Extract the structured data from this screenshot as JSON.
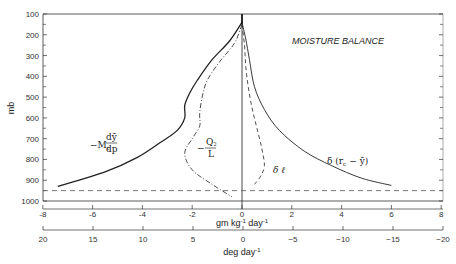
{
  "chart_data": {
    "type": "line",
    "title": "MOISTURE BALANCE",
    "ylabel": "mb",
    "y_ticks": [
      100,
      200,
      300,
      400,
      500,
      600,
      700,
      800,
      900,
      1000
    ],
    "ylim": [
      100,
      1000
    ],
    "y_inverted": true,
    "xaxes": [
      {
        "label": "gm kg⁻¹ day⁻¹",
        "ticks": [
          -8,
          -6,
          -4,
          -2,
          0,
          2,
          4,
          6,
          8
        ],
        "range": [
          -8,
          8
        ]
      },
      {
        "label": "deg day⁻¹",
        "ticks": [
          20,
          15,
          10,
          5,
          0,
          -5,
          -10,
          -15,
          -20
        ],
        "range": [
          20,
          -20
        ]
      }
    ],
    "reference_lines": [
      {
        "type": "vertical",
        "x": 0,
        "style": "solid"
      },
      {
        "type": "horizontal",
        "y": 950,
        "style": "dashed"
      }
    ],
    "series": [
      {
        "name": "-Mc dȳ/dp",
        "style": "solid",
        "points": [
          [
            0,
            140
          ],
          [
            -0.5,
            230
          ],
          [
            -1.2,
            320
          ],
          [
            -1.8,
            420
          ],
          [
            -2.1,
            480
          ],
          [
            -2.3,
            540
          ],
          [
            -2.3,
            600
          ],
          [
            -2.6,
            660
          ],
          [
            -3.3,
            720
          ],
          [
            -4.2,
            790
          ],
          [
            -5.5,
            860
          ],
          [
            -7.4,
            930
          ]
        ]
      },
      {
        "name": "-Q2/L",
        "style": "dash-dot",
        "points": [
          [
            0,
            150
          ],
          [
            -0.3,
            240
          ],
          [
            -0.9,
            330
          ],
          [
            -1.4,
            420
          ],
          [
            -1.6,
            500
          ],
          [
            -1.7,
            580
          ],
          [
            -1.7,
            640
          ],
          [
            -2.0,
            700
          ],
          [
            -2.3,
            770
          ],
          [
            -2.0,
            850
          ],
          [
            -1.2,
            920
          ],
          [
            -0.4,
            980
          ]
        ]
      },
      {
        "name": "δ ℓ",
        "style": "dashed",
        "points": [
          [
            0,
            150
          ],
          [
            0.1,
            250
          ],
          [
            0.15,
            350
          ],
          [
            0.25,
            450
          ],
          [
            0.4,
            550
          ],
          [
            0.6,
            650
          ],
          [
            0.8,
            750
          ],
          [
            0.9,
            830
          ],
          [
            0.75,
            880
          ],
          [
            0.5,
            920
          ]
        ]
      },
      {
        "name": "δ (rc - ȳ)",
        "style": "solid-thin",
        "points": [
          [
            0,
            140
          ],
          [
            0.15,
            220
          ],
          [
            0.3,
            320
          ],
          [
            0.5,
            450
          ],
          [
            0.9,
            560
          ],
          [
            1.5,
            660
          ],
          [
            2.5,
            760
          ],
          [
            3.6,
            830
          ],
          [
            4.8,
            890
          ],
          [
            6.0,
            925
          ]
        ]
      }
    ],
    "annotations": [
      {
        "text": "MOISTURE BALANCE",
        "x": 1.5,
        "y": 200
      },
      {
        "text": "-Mc dȳ/dp",
        "x": -5.8,
        "y": 745
      },
      {
        "text": "-Q2/L",
        "x": -1.4,
        "y": 750
      },
      {
        "text": "δ ℓ",
        "x": 1.8,
        "y": 855
      },
      {
        "text": "δ (rc - ȳ)",
        "x": 3.7,
        "y": 820
      }
    ],
    "grid": false,
    "legend": "none"
  },
  "labels": {
    "title": "MOISTURE BALANCE",
    "ylabel": "mb",
    "xlabel1": "gm kg",
    "xlabel1_sup1": "-1",
    "xlabel1_mid": " day",
    "xlabel1_sup2": "-1",
    "xlabel2": "deg day",
    "xlabel2_sup": "-1",
    "anno_mc_prefix": "−M",
    "anno_mc_sub": "c",
    "anno_mc_num": "dȳ",
    "anno_mc_den": "dp",
    "anno_q2_minus": "−",
    "anno_q2_num": "Q",
    "anno_q2_sub": "2",
    "anno_q2_den": "L",
    "anno_dl": "δ ℓ",
    "anno_drc_prefix": "δ (r",
    "anno_drc_sub": "c",
    "anno_drc_suffix": " − ȳ)"
  }
}
